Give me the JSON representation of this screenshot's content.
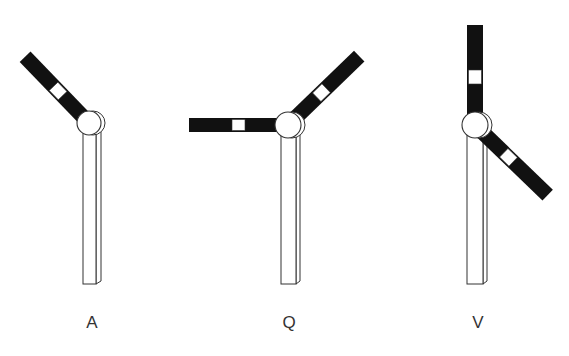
{
  "figure": {
    "background": "#ffffff",
    "arm_color": "#111111",
    "outline_color": "#333333",
    "signals": [
      {
        "label": "A",
        "label_x": 92,
        "pole": {
          "x": 83,
          "width": 13,
          "side": 5,
          "top": 128,
          "bottom": 284
        },
        "hub": {
          "cx": 89,
          "cy": 123,
          "r": 12,
          "shadow_dx": 4
        },
        "arms": [
          {
            "angle_deg": 226,
            "length": 92,
            "width": 15,
            "band_start": 38,
            "band_len": 13
          }
        ]
      },
      {
        "label": "Q",
        "label_x": 289,
        "pole": {
          "x": 281,
          "width": 15,
          "side": 4,
          "top": 130,
          "bottom": 284
        },
        "hub": {
          "cx": 288,
          "cy": 125,
          "r": 13,
          "shadow_dx": 4
        },
        "arms": [
          {
            "angle_deg": 180,
            "length": 99,
            "width": 14,
            "band_start": 43,
            "band_len": 13
          },
          {
            "angle_deg": 316,
            "length": 99,
            "width": 15,
            "band_start": 40,
            "band_len": 13
          }
        ]
      },
      {
        "label": "V",
        "label_x": 478,
        "pole": {
          "x": 467,
          "width": 16,
          "side": 4,
          "top": 130,
          "bottom": 284
        },
        "hub": {
          "cx": 475,
          "cy": 125,
          "r": 13,
          "shadow_dx": 4
        },
        "arms": [
          {
            "angle_deg": 270,
            "length": 100,
            "width": 16,
            "band_start": 41,
            "band_len": 14
          },
          {
            "angle_deg": 44,
            "length": 101,
            "width": 15,
            "band_start": 40,
            "band_len": 13
          }
        ]
      }
    ]
  }
}
